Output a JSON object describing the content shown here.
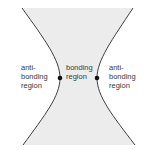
{
  "diagram": {
    "regions": {
      "left": {
        "lines": [
          "anti-",
          "bonding",
          "region"
        ]
      },
      "center": {
        "lines": [
          "bonding",
          "region"
        ]
      },
      "right": {
        "lines": [
          "anti-",
          "bonding",
          "region"
        ]
      }
    },
    "colors": {
      "fill": "#ececec",
      "curve": "#2a2a2a",
      "text": "#3a3a3a",
      "nucleus": "#111111"
    },
    "nuclei": [
      {
        "x": 60,
        "y": 78
      },
      {
        "x": 97,
        "y": 78
      }
    ]
  }
}
